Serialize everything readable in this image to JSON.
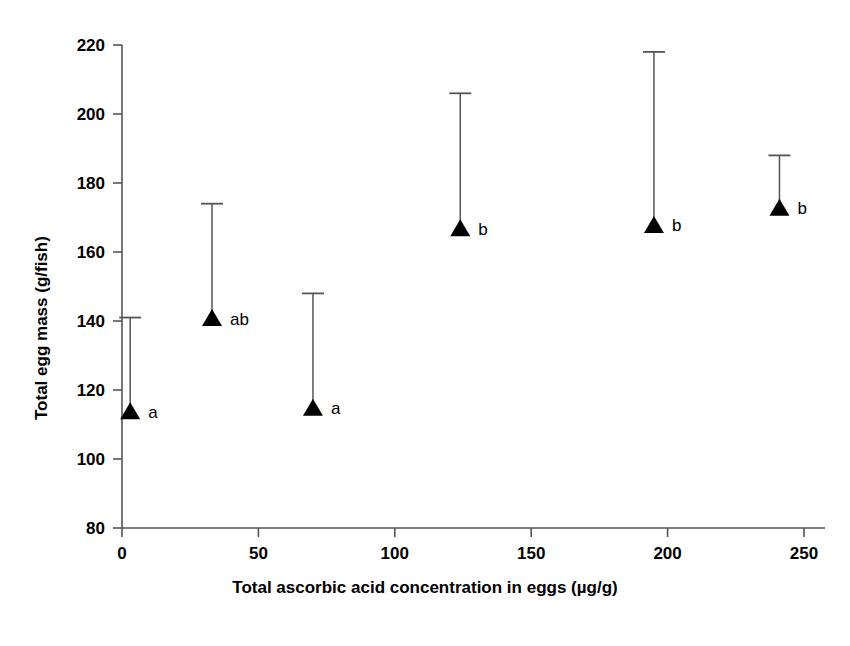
{
  "chart_data": {
    "type": "scatter",
    "title": "",
    "subtitle": "",
    "xlabel": "Total ascorbic acid concentration in eggs (µg/g)",
    "ylabel": "Total egg mass (g/fish)",
    "xlim": [
      0,
      255
    ],
    "ylim": [
      80,
      220
    ],
    "xticks": [
      0,
      50,
      100,
      150,
      200,
      250
    ],
    "yticks": [
      80,
      100,
      120,
      140,
      160,
      180,
      200,
      220
    ],
    "xticklabels": [
      "0",
      "50",
      "100",
      "150",
      "200",
      "250"
    ],
    "yticklabels": [
      "80",
      "100",
      "120",
      "140",
      "160",
      "180",
      "200",
      "220"
    ],
    "grid": false,
    "legend": "none",
    "marker": "filled-triangle",
    "error_bars": "upper-only",
    "x": [
      3,
      33,
      70,
      124,
      195,
      241
    ],
    "y": [
      114,
      141,
      115,
      167,
      168,
      173
    ],
    "error_upper": [
      141,
      174,
      148,
      206,
      218,
      188
    ],
    "annotations": [
      "a",
      "ab",
      "a",
      "b",
      "b",
      "b"
    ],
    "points": [
      {
        "x": 3,
        "y": 114,
        "err_top": 141,
        "label": "a"
      },
      {
        "x": 33,
        "y": 141,
        "err_top": 174,
        "label": "ab"
      },
      {
        "x": 70,
        "y": 115,
        "err_top": 148,
        "label": "a"
      },
      {
        "x": 124,
        "y": 167,
        "err_top": 206,
        "label": "b"
      },
      {
        "x": 195,
        "y": 168,
        "err_top": 218,
        "label": "b"
      },
      {
        "x": 241,
        "y": 173,
        "err_top": 188,
        "label": "b"
      }
    ],
    "colors": {
      "marker": "#000000",
      "error_bar": "#555555",
      "axis": "#555555",
      "text": "#000000",
      "background": "#ffffff"
    }
  }
}
